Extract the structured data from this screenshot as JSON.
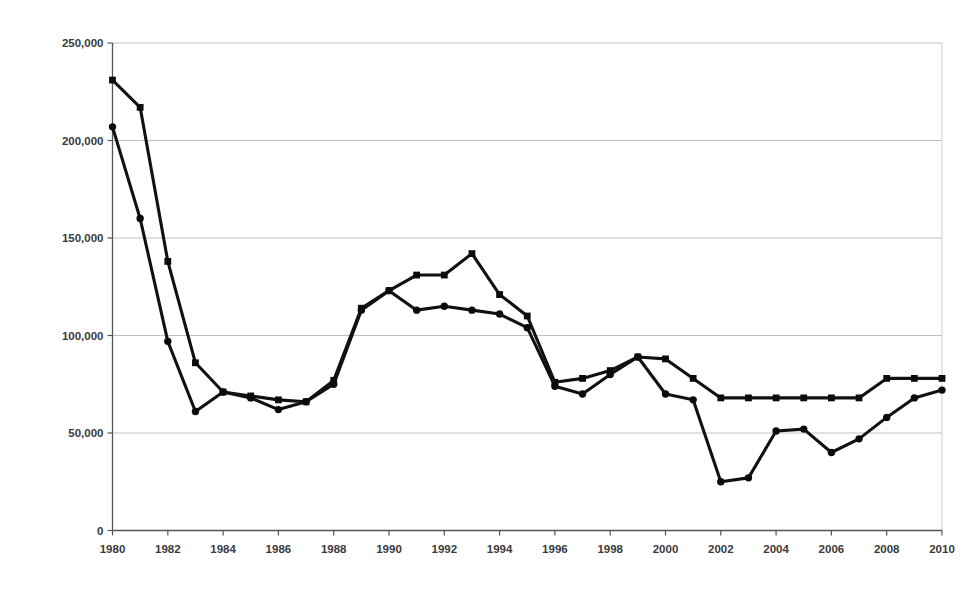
{
  "chart_data": {
    "type": "line",
    "title": "",
    "xlabel": "",
    "ylabel": "",
    "xlim": [
      1980,
      2010
    ],
    "ylim": [
      0,
      250000
    ],
    "grid": true,
    "legend": "none",
    "x_ticks": [
      "1980",
      "1982",
      "1984",
      "1986",
      "1988",
      "1990",
      "1992",
      "1994",
      "1996",
      "1998",
      "2000",
      "2002",
      "2004",
      "2006",
      "2008",
      "2010"
    ],
    "y_ticks": [
      "0",
      "50,000",
      "100,000",
      "150,000",
      "200,000",
      "250,000"
    ],
    "x": [
      1980,
      1981,
      1982,
      1983,
      1984,
      1985,
      1986,
      1987,
      1988,
      1989,
      1990,
      1991,
      1992,
      1993,
      1994,
      1995,
      1996,
      1997,
      1998,
      1999,
      2000,
      2001,
      2002,
      2003,
      2004,
      2005,
      2006,
      2007,
      2008,
      2009,
      2010
    ],
    "series": [
      {
        "name": "Series 1",
        "marker": "square",
        "values": [
          231000,
          217000,
          138000,
          86000,
          71000,
          69000,
          67000,
          66000,
          77000,
          114000,
          123000,
          131000,
          131000,
          142000,
          121000,
          110000,
          76000,
          78000,
          82000,
          89000,
          88000,
          78000,
          68000,
          68000,
          68000,
          68000,
          68000,
          68000,
          78000,
          78000,
          78000
        ]
      },
      {
        "name": "Series 2",
        "marker": "circle",
        "values": [
          207000,
          160000,
          97000,
          61000,
          71000,
          68000,
          62000,
          66000,
          75000,
          113000,
          123000,
          113000,
          115000,
          113000,
          111000,
          104000,
          74000,
          70000,
          80000,
          89000,
          70000,
          67000,
          25000,
          27000,
          51000,
          52000,
          40000,
          47000,
          58000,
          68000,
          72000
        ]
      }
    ]
  },
  "axes": {
    "y_tick_values": [
      0,
      50000,
      100000,
      150000,
      200000,
      250000
    ],
    "x_tick_values": [
      1980,
      1982,
      1984,
      1986,
      1988,
      1990,
      1992,
      1994,
      1996,
      1998,
      2000,
      2002,
      2004,
      2006,
      2008,
      2010
    ]
  },
  "colors": {
    "line": "#111111",
    "grid": "#b9b9b9",
    "axis": "#555555",
    "text": "#3a3a3a",
    "background": "#ffffff"
  }
}
